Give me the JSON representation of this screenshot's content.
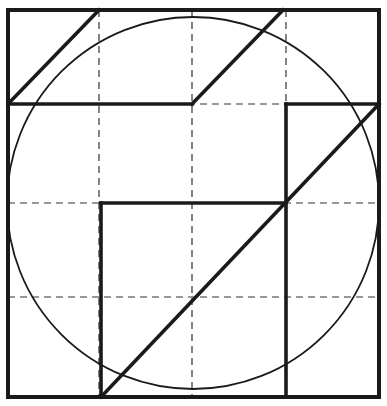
{
  "diagram": {
    "type": "geometric-construction",
    "colors": {
      "ink": "#1a1a1a",
      "background": "#ffffff",
      "grid": "#333333"
    },
    "outer_square": {
      "x1": 8,
      "y1": 10,
      "x2": 379,
      "y2": 397
    },
    "grid": {
      "vertical_x": [
        99,
        192,
        286
      ],
      "horizontal_y": [
        104,
        203,
        297
      ]
    },
    "circle": {
      "cx": 193,
      "cy": 203,
      "r": 186
    },
    "bold_segments": [
      {
        "id": "top-left-diagonal",
        "x1": 8,
        "y1": 104,
        "x2": 99,
        "y2": 10
      },
      {
        "id": "upper-band-bottom",
        "x1": 8,
        "y1": 104,
        "x2": 192,
        "y2": 104
      },
      {
        "id": "top-mid-diagonal",
        "x1": 192,
        "y1": 104,
        "x2": 283,
        "y2": 10
      },
      {
        "id": "right-inner-top",
        "x1": 286,
        "y1": 104,
        "x2": 379,
        "y2": 104
      },
      {
        "id": "right-inner-vertical",
        "x1": 286,
        "y1": 104,
        "x2": 286,
        "y2": 397
      },
      {
        "id": "inner-square-top",
        "x1": 101,
        "y1": 203,
        "x2": 286,
        "y2": 203
      },
      {
        "id": "inner-square-left",
        "x1": 101,
        "y1": 203,
        "x2": 101,
        "y2": 397
      },
      {
        "id": "long-diagonal",
        "x1": 101,
        "y1": 397,
        "x2": 379,
        "y2": 104
      }
    ]
  }
}
